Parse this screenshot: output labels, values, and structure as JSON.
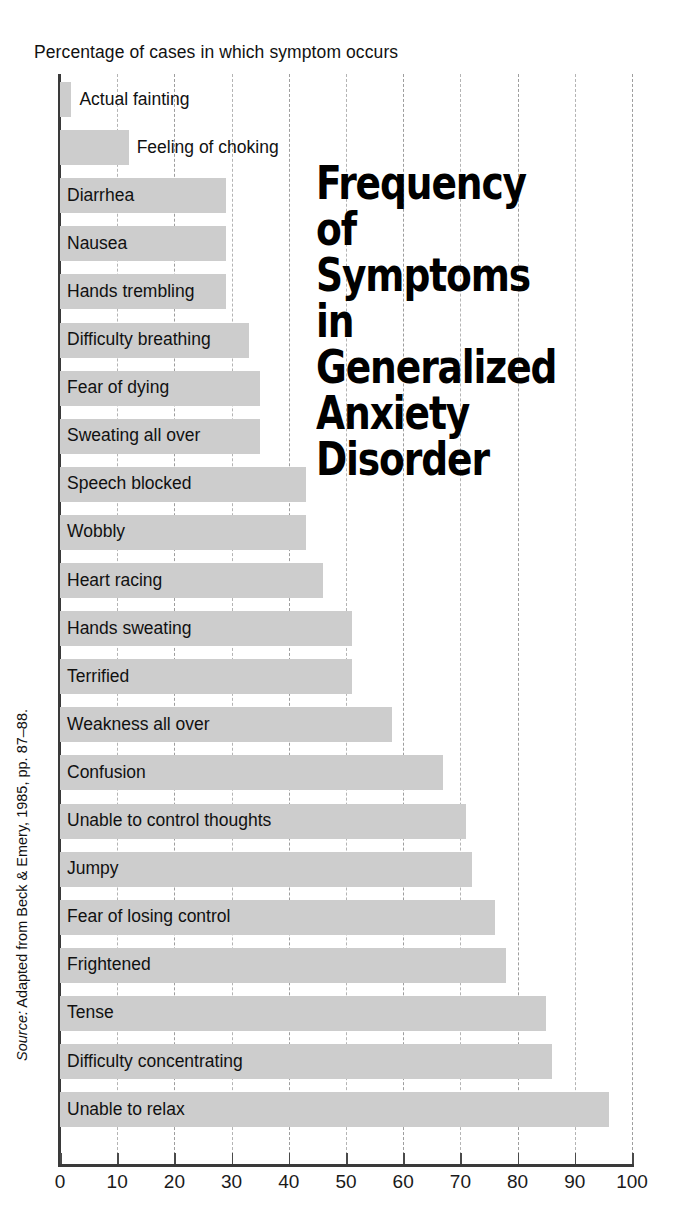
{
  "chart_data": {
    "type": "bar",
    "orientation": "horizontal",
    "title": "Frequency of Symptoms in Generalized Anxiety Disorder",
    "xlabel": "Percentage of cases in which symptom occurs",
    "ylabel": "",
    "xlim": [
      0,
      100
    ],
    "xticks": [
      0,
      10,
      20,
      30,
      40,
      50,
      60,
      70,
      80,
      90,
      100
    ],
    "xtick_labels": [
      "0",
      "10",
      "20",
      "30",
      "40",
      "50",
      "60",
      "70",
      "80",
      "90",
      "100"
    ],
    "grid": true,
    "grid_axis": "x",
    "legend": false,
    "bar_color": "#cdcdcd",
    "categories": [
      "Actual fainting",
      "Feeling of choking",
      "Diarrhea",
      "Nausea",
      "Hands trembling",
      "Difficulty breathing",
      "Fear of dying",
      "Sweating all over",
      "Speech blocked",
      "Wobbly",
      "Heart racing",
      "Hands sweating",
      "Terrified",
      "Weakness all over",
      "Confusion",
      "Unable to control thoughts",
      "Jumpy",
      "Fear of losing control",
      "Frightened",
      "Tense",
      "Difficulty concentrating",
      "Unable to relax"
    ],
    "values": [
      2,
      12,
      29,
      29,
      29,
      33,
      35,
      35,
      43,
      43,
      46,
      51,
      51,
      58,
      67,
      71,
      72,
      76,
      78,
      85,
      86,
      96
    ],
    "source": "Source: Adapted from Beck & Emery, 1985, pp. 87–88."
  },
  "caption": {
    "axis_caption": "Percentage of cases in which symptom occurs"
  },
  "title": {
    "text": "Frequency of\nSymptoms in\nGeneralized\nAnxiety\nDisorder"
  },
  "source": {
    "label": "Source:",
    "text": " Adapted from Beck & Emery, 1985, pp. 87–88."
  }
}
